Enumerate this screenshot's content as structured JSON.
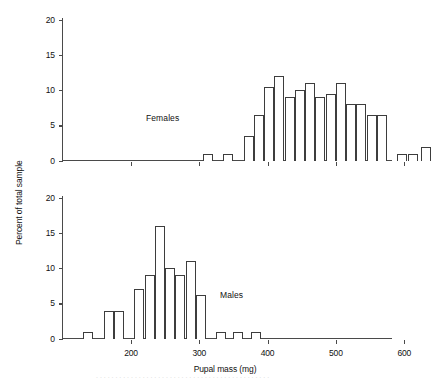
{
  "figure": {
    "y_axis_title": "Percent of total sample",
    "x_axis_title": "Pupal mass (mg)",
    "y_ticks": [
      "0",
      "5",
      "10",
      "15",
      "20"
    ],
    "x_ticks": [
      "200",
      "300",
      "400",
      "500",
      "600"
    ]
  },
  "panels": {
    "top": {
      "label": "Females"
    },
    "bottom": {
      "label": "Males"
    }
  },
  "chart_data": {
    "type": "bar",
    "title": "",
    "subtitle": "",
    "xlabel": "Pupal mass (mg)",
    "ylabel": "Percent of total sample",
    "xlim": [
      100,
      600
    ],
    "ylim": [
      0,
      20
    ],
    "grid": false,
    "legend": "none",
    "annotations": [
      "Females",
      "Males"
    ],
    "bin_width_mg": 15,
    "xticks": [
      200,
      300,
      400,
      500,
      600
    ],
    "yticks": [
      0,
      5,
      10,
      15,
      20
    ],
    "panels": [
      {
        "name": "Females",
        "bin_starts_mg": [
          305,
          320,
          335,
          350,
          365,
          380,
          395,
          410,
          425,
          440,
          455,
          470,
          485,
          500,
          515,
          530,
          545,
          560
        ],
        "values": [
          1,
          1,
          3.5,
          6.5,
          10.5,
          12,
          9,
          10,
          11,
          9,
          9.5,
          11,
          8,
          8,
          6.5,
          6.5,
          1,
          1,
          2
        ],
        "bars": [
          {
            "mass": 305,
            "percent": 1
          },
          {
            "mass": 335,
            "percent": 1
          },
          {
            "mass": 365,
            "percent": 3.5
          },
          {
            "mass": 380,
            "percent": 6.5
          },
          {
            "mass": 395,
            "percent": 10.5
          },
          {
            "mass": 410,
            "percent": 12
          },
          {
            "mass": 425,
            "percent": 9
          },
          {
            "mass": 440,
            "percent": 10
          },
          {
            "mass": 455,
            "percent": 11
          },
          {
            "mass": 470,
            "percent": 9
          },
          {
            "mass": 485,
            "percent": 9.5
          },
          {
            "mass": 500,
            "percent": 11
          },
          {
            "mass": 515,
            "percent": 8
          },
          {
            "mass": 530,
            "percent": 8
          },
          {
            "mass": 545,
            "percent": 6.5
          },
          {
            "mass": 560,
            "percent": 6.5
          },
          {
            "mass": 590,
            "percent": 1
          },
          {
            "mass": 605,
            "percent": 1
          },
          {
            "mass": 625,
            "percent": 2
          }
        ]
      },
      {
        "name": "Males",
        "bars": [
          {
            "mass": 130,
            "percent": 1
          },
          {
            "mass": 160,
            "percent": 4
          },
          {
            "mass": 175,
            "percent": 4
          },
          {
            "mass": 205,
            "percent": 7
          },
          {
            "mass": 220,
            "percent": 9
          },
          {
            "mass": 235,
            "percent": 16
          },
          {
            "mass": 250,
            "percent": 10
          },
          {
            "mass": 265,
            "percent": 9
          },
          {
            "mass": 280,
            "percent": 11
          },
          {
            "mass": 295,
            "percent": 6.2
          },
          {
            "mass": 325,
            "percent": 1
          },
          {
            "mass": 350,
            "percent": 1
          },
          {
            "mass": 375,
            "percent": 1
          }
        ]
      }
    ]
  }
}
